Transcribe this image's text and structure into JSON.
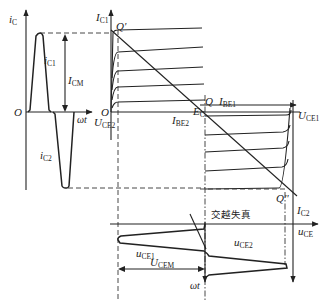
{
  "figure": {
    "left_waveform": {
      "axis_y_label": "i",
      "axis_y_sub": "C",
      "origin_label": "O",
      "axis_x_label": "ωt",
      "pos_pulse_label": "i",
      "pos_pulse_sub": "C1",
      "neg_pulse_label": "i",
      "neg_pulse_sub": "C2",
      "amplitude_label": "I",
      "amplitude_sub": "CM"
    },
    "characteristics": {
      "upper_axis_label": "I",
      "upper_axis_sub": "C1",
      "upper_origin": "O",
      "q_prime": "Q'",
      "q": "Q",
      "q_double_prime": "Q''",
      "ib_upper": "I",
      "ib_upper_sub": "BE1",
      "ib_lower": "I",
      "ib_lower_sub": "BE2",
      "ec_label": "E",
      "ec_sub": "C",
      "uce1_label": "U",
      "uce1_sub": "CE1",
      "uce2_label": "U",
      "uce2_sub": "CE2",
      "lower_axis_label": "I",
      "lower_axis_sub": "C2"
    },
    "output_waveform": {
      "axis_x_label": "u",
      "axis_x_sub": "CE",
      "axis_y_label": "ωt",
      "annotation": "交越失真",
      "wave1_label": "u",
      "wave1_sub": "CE1",
      "wave2_label": "u",
      "wave2_sub": "CE2",
      "amplitude_label": "U",
      "amplitude_sub": "CEM"
    }
  }
}
